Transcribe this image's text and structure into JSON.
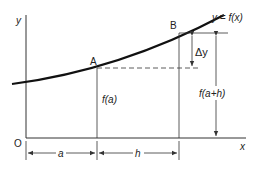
{
  "diagram": {
    "type": "derivative-secant-construction",
    "curve_label": "y = f(x)",
    "axes": {
      "y_label": "y",
      "x_label": "x",
      "origin_label": "O"
    },
    "points": [
      {
        "name": "A",
        "label": "A"
      },
      {
        "name": "B",
        "label": "B"
      }
    ],
    "vertical_labels": {
      "fa": "f(a)",
      "fah": "f(a+h)",
      "delta_y": "Δy"
    },
    "horizontal_labels": {
      "a": "a",
      "h": "h"
    },
    "colors": {
      "curve": "#111111",
      "lines": "#333333",
      "background": "#ffffff"
    }
  }
}
